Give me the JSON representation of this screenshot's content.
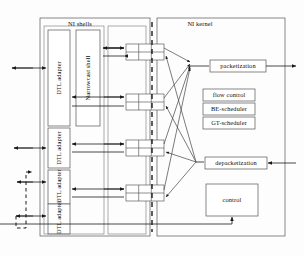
{
  "diagram": {
    "title_shells": "NI shells",
    "title_kernel": "NI kernel",
    "groups": [
      {
        "name": "ni-shells",
        "label": "NI shells",
        "x": 40,
        "y": 18,
        "w": 110,
        "h": 218
      },
      {
        "name": "ni-kernel",
        "label": "NI kernel",
        "x": 157,
        "y": 18,
        "w": 128,
        "h": 218
      }
    ],
    "shell_blocks": [
      {
        "name": "dtl-adapter-1",
        "label": "DTL adapter",
        "orientation": "vertical",
        "x": 48,
        "y": 30,
        "w": 22,
        "h": 96
      },
      {
        "name": "narrowcast-shell",
        "label": "Narrowcast shell",
        "orientation": "vertical",
        "x": 76,
        "y": 30,
        "w": 24,
        "h": 96
      },
      {
        "name": "dtl-adapter-2",
        "label": "DTL adapter",
        "orientation": "vertical",
        "x": 48,
        "y": 128,
        "w": 22,
        "h": 40
      },
      {
        "name": "dtl-adapter-3",
        "label": "DTL adapter",
        "orientation": "vertical",
        "x": 48,
        "y": 170,
        "w": 22,
        "h": 34
      },
      {
        "name": "dtl-adapter-4",
        "label": "DTL adapter",
        "orientation": "vertical",
        "x": 48,
        "y": 204,
        "w": 22,
        "h": 30
      }
    ],
    "kernel_blocks": [
      {
        "name": "packetization",
        "label": "packetization",
        "x": 210,
        "y": 60,
        "w": 56,
        "h": 12
      },
      {
        "name": "flow-control",
        "label": "flow control",
        "x": 203,
        "y": 89,
        "w": 52,
        "h": 12
      },
      {
        "name": "be-scheduler",
        "label": "BE-scheduler",
        "x": 203,
        "y": 103,
        "w": 52,
        "h": 12
      },
      {
        "name": "gt-scheduler",
        "label": "GT-scheduler",
        "x": 203,
        "y": 117,
        "w": 52,
        "h": 12
      },
      {
        "name": "depacketization",
        "label": "depacketization",
        "x": 205,
        "y": 157,
        "w": 62,
        "h": 12
      },
      {
        "name": "control",
        "label": "control",
        "x": 206,
        "y": 184,
        "w": 52,
        "h": 32
      }
    ],
    "fifos": [
      {
        "name": "fifo-1",
        "x": 126,
        "y": 44,
        "w": 38,
        "h": 16,
        "cols": 3,
        "rows": 2
      },
      {
        "name": "fifo-2",
        "x": 126,
        "y": 94,
        "w": 38,
        "h": 16,
        "cols": 3,
        "rows": 2
      },
      {
        "name": "fifo-3",
        "x": 126,
        "y": 140,
        "w": 38,
        "h": 16,
        "cols": 3,
        "rows": 2
      },
      {
        "name": "fifo-4",
        "x": 126,
        "y": 185,
        "w": 38,
        "h": 16,
        "cols": 3,
        "rows": 2
      }
    ],
    "dashed_divider": {
      "name": "clock-domain-boundary",
      "x": 152,
      "y1": 22,
      "y2": 232
    },
    "external_ports": [
      {
        "name": "port-left-1",
        "y": 68
      },
      {
        "name": "port-left-2",
        "y": 148
      },
      {
        "name": "port-left-3",
        "y": 182
      },
      {
        "name": "port-left-4",
        "y": 216
      },
      {
        "name": "port-right-out",
        "y": 66
      },
      {
        "name": "port-right-in",
        "y": 163
      }
    ]
  }
}
